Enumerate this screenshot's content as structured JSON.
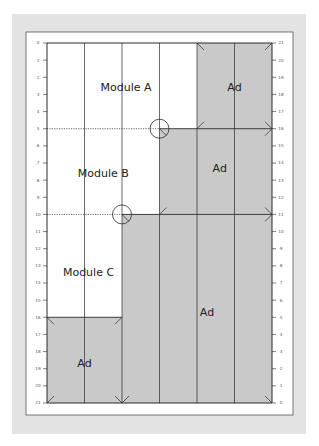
{
  "diagram": {
    "grid": {
      "columns": 6,
      "rows": 21
    },
    "left_axis_ticks": [
      "0",
      "1",
      "2",
      "3",
      "4",
      "5",
      "6",
      "7",
      "8",
      "9",
      "10",
      "11",
      "12",
      "13",
      "14",
      "15",
      "16",
      "17",
      "18",
      "19",
      "20",
      "21"
    ],
    "right_axis_ticks": [
      "21",
      "20",
      "19",
      "18",
      "17",
      "16",
      "15",
      "14",
      "13",
      "12",
      "11",
      "10",
      "9",
      "8",
      "7",
      "6",
      "5",
      "4",
      "3",
      "2",
      "1",
      "0"
    ],
    "modules": [
      {
        "label": "Module A",
        "type": "editorial",
        "cols": [
          0,
          4
        ],
        "rows": [
          0,
          5
        ]
      },
      {
        "label": "Module B",
        "type": "editorial",
        "cols": [
          0,
          3
        ],
        "rows": [
          5,
          10
        ]
      },
      {
        "label": "Module C",
        "type": "editorial",
        "cols": [
          0,
          2
        ],
        "rows": [
          10,
          16
        ]
      },
      {
        "label": "Ad",
        "type": "ad",
        "cols": [
          4,
          6
        ],
        "rows": [
          0,
          5
        ]
      },
      {
        "label": "Ad",
        "type": "ad",
        "cols": [
          3,
          6
        ],
        "rows": [
          5,
          10
        ]
      },
      {
        "label": "Ad",
        "type": "ad",
        "cols": [
          2,
          6
        ],
        "rows": [
          10,
          21
        ]
      },
      {
        "label": "Ad",
        "type": "ad",
        "cols": [
          0,
          2
        ],
        "rows": [
          16,
          21
        ]
      }
    ],
    "colors": {
      "panel": "#e3e3e3",
      "page": "#ffffff",
      "ad_fill": "#c9c9c9",
      "line": "#2a2a2a"
    }
  }
}
